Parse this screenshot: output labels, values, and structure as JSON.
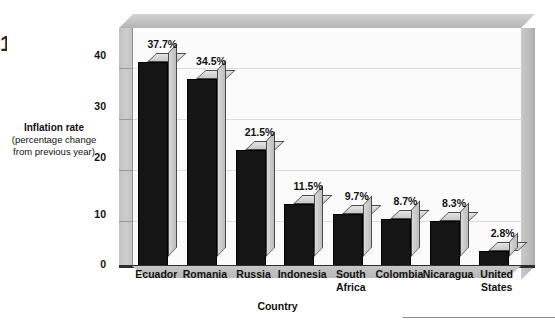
{
  "figure": {
    "edge_glyph": "1"
  },
  "axes": {
    "y_caption_line1": "Inflation rate",
    "y_caption_line2": "(percentage change",
    "y_caption_line3": "from previous year)",
    "x_title": "Country",
    "y_ticks": [
      "40",
      "30",
      "20",
      "10",
      "0"
    ]
  },
  "colors": {
    "bar_front": "#151515",
    "bar_top": "#d6d6d6",
    "bar_side": "#c6c6c6",
    "wall": "#c2c2c2",
    "canvas": "#fbfbfb",
    "gridline": "#dcdcdc",
    "text": "#111111"
  },
  "chart_data": {
    "type": "bar",
    "title": "",
    "subtitle": "",
    "xlabel": "Country",
    "ylabel": "Inflation rate (percentage change from previous year)",
    "ylim": [
      0,
      44
    ],
    "yticks": [
      0,
      10,
      20,
      30,
      40
    ],
    "grid": true,
    "legend": false,
    "legend_position": "none",
    "style": "3d-bar",
    "categories": [
      "Ecuador",
      "Romania",
      "Russia",
      "Indonesia",
      "South Africa",
      "Colombia",
      "Nicaragua",
      "United States"
    ],
    "category_label_lines": [
      [
        "Ecuador"
      ],
      [
        "Romania"
      ],
      [
        "Russia"
      ],
      [
        "Indonesia"
      ],
      [
        "South",
        "Africa"
      ],
      [
        "Colombia"
      ],
      [
        "Nicaragua"
      ],
      [
        "United",
        "States"
      ]
    ],
    "values": [
      37.7,
      34.5,
      21.5,
      11.5,
      9.7,
      8.7,
      8.3,
      2.8
    ],
    "data_labels": [
      "37.7%",
      "34.5%",
      "21.5%",
      "11.5%",
      "9.7%",
      "8.7%",
      "8.3%",
      "2.8%"
    ],
    "units": "percent"
  }
}
